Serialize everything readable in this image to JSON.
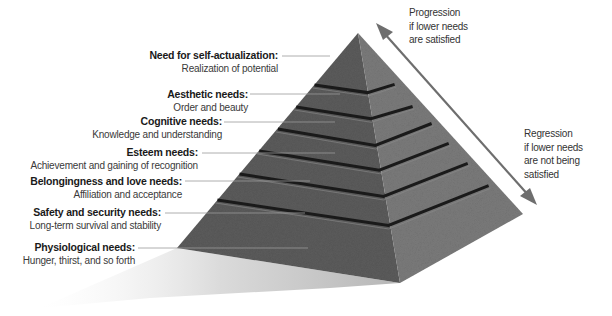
{
  "diagram": {
    "type": "pyramid",
    "levels": [
      {
        "title": "Need for self-actualization:",
        "description": "Realization of potential"
      },
      {
        "title": "Aesthetic needs:",
        "description": "Order and beauty"
      },
      {
        "title": "Cognitive needs:",
        "description": "Knowledge and understanding"
      },
      {
        "title": "Esteem needs:",
        "description": "Achievement and gaining of recognition"
      },
      {
        "title": "Belongingness and love needs:",
        "description": "Affiliation and acceptance"
      },
      {
        "title": "Safety and security needs:",
        "description": "Long-term survival and stability"
      },
      {
        "title": "Physiological needs:",
        "description": "Hunger, thirst, and so forth"
      }
    ],
    "arrow": {
      "progression": "Progression\nif lower needs\nare satisfied",
      "regression": "Regression\nif lower needs\nare not being\nsatisfied",
      "progression_lines": [
        "Progression",
        "if lower needs",
        "are satisfied"
      ],
      "regression_lines": [
        "Regression",
        "if lower needs",
        "are not being",
        "satisfied"
      ]
    },
    "colors": {
      "left_face": "#5a5a5a",
      "right_face": "#7a7a7a",
      "groove": "#1c1c1c",
      "shadow": "#bdbdbd",
      "arrow": "#6e6e6e",
      "leader_line": "#9a9a9a"
    }
  }
}
